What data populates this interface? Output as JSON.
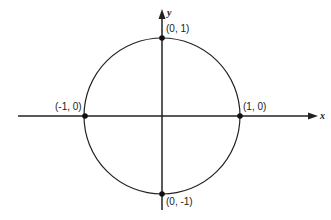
{
  "diagram": {
    "title": "",
    "axes": {
      "x_label": "x",
      "y_label": "y"
    },
    "circle": {
      "center": [
        0,
        0
      ],
      "radius": 1
    },
    "points": [
      {
        "label": "(0, 1)",
        "coord": [
          0,
          1
        ]
      },
      {
        "label": "(-1, 0)",
        "coord": [
          -1,
          0
        ]
      },
      {
        "label": "(1, 0)",
        "coord": [
          1,
          0
        ]
      },
      {
        "label": "(0, -1)",
        "coord": [
          0,
          -1
        ]
      }
    ],
    "colors": {
      "stroke": "#222222",
      "background": "#ffffff"
    }
  }
}
